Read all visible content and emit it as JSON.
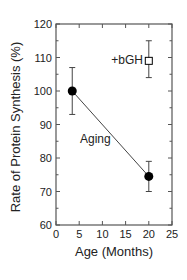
{
  "chart_data": {
    "type": "scatter",
    "title": "",
    "xlabel": "Age (Months)",
    "ylabel": "Rate of Protein Synthesis (%)",
    "xlim": [
      0,
      25
    ],
    "ylim": [
      60,
      120
    ],
    "xticks": [
      0,
      5,
      10,
      15,
      20,
      25
    ],
    "yticks": [
      60,
      70,
      80,
      90,
      100,
      110,
      120
    ],
    "grid": false,
    "series": [
      {
        "name": "Aging",
        "marker": "filled-circle",
        "connected": true,
        "points": [
          {
            "x": 3.5,
            "y": 100,
            "err_low": 93,
            "err_high": 107
          },
          {
            "x": 20,
            "y": 74.5,
            "err_low": 70,
            "err_high": 79
          }
        ]
      },
      {
        "name": "+bGH",
        "marker": "open-square",
        "connected": false,
        "points": [
          {
            "x": 20,
            "y": 109,
            "err_low": 104,
            "err_high": 115
          }
        ]
      }
    ],
    "annotations": [
      {
        "text": "Aging",
        "x": 8,
        "y": 86
      },
      {
        "text": "+bGH",
        "x": 15,
        "y": 109
      }
    ]
  },
  "labels": {
    "xlabel": "Age (Months)",
    "ylabel": "Rate of Protein Synthesis (%)",
    "aging": "Aging",
    "bgh": "+bGH"
  },
  "colors": {
    "axis": "#555555",
    "data": "#000000",
    "line": "#444444"
  }
}
